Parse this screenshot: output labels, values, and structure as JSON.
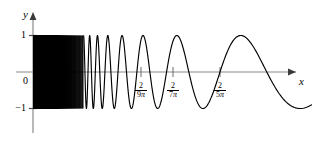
{
  "figure": {
    "background_color": "#ffffff",
    "curve_color": "#000000",
    "axis_color": "#808080",
    "width": 312,
    "height": 141
  },
  "axes": {
    "x_label": "x",
    "y_label": "y",
    "origin_label": "0",
    "y_ticks": [
      {
        "label": "1",
        "value": 1
      },
      {
        "label": "−1",
        "value": -1
      }
    ],
    "x_ticks": [
      {
        "numerator": "2",
        "denominator_num": "9",
        "denominator_sym": "π",
        "label": "2/(9π)",
        "value": 0.070736
      },
      {
        "numerator": "2",
        "denominator_num": "7",
        "denominator_sym": "π",
        "label": "2/(7π)",
        "value": 0.090946
      },
      {
        "numerator": "2",
        "denominator_num": "5",
        "denominator_sym": "π",
        "label": "2/(5π)",
        "value": 0.127324
      }
    ]
  },
  "chart_data": {
    "type": "line",
    "title": "",
    "xlabel": "x",
    "ylabel": "y",
    "function": "y = sin(2/x)",
    "xlim": [
      0,
      0.33
    ],
    "ylim": [
      -1.15,
      1.15
    ],
    "grid": false,
    "legend": null,
    "x_tick_values": [
      0.070736,
      0.090946,
      0.127324
    ],
    "x_tick_labels": [
      "2/(9π)",
      "2/(7π)",
      "2/(5π)"
    ],
    "y_tick_values": [
      1,
      -1
    ],
    "y_tick_labels": [
      "1",
      "−1"
    ],
    "series": [
      {
        "name": "sin(2/x)",
        "color": "#000000",
        "maxima_x": [
          0.070736,
          0.090946,
          0.127324,
          0.212207
        ],
        "maxima_y": [
          1,
          1,
          1,
          1
        ],
        "minima_x": [
          0.079577,
          0.106103,
          0.159155
        ],
        "minima_y": [
          -1,
          -1,
          -1
        ],
        "zeros_x": [
          0.063662,
          0.074934,
          0.084883,
          0.098049,
          0.114591,
          0.141471,
          0.181891,
          0.254648,
          0.63662
        ]
      }
    ]
  }
}
